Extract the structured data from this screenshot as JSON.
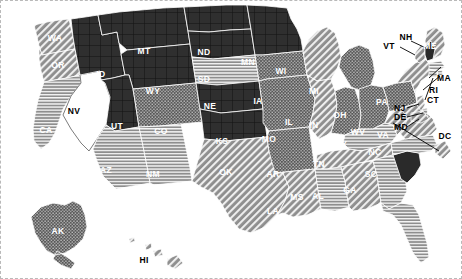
{
  "map": {
    "title": "United States Pattern Choropleth Map",
    "background_color": "#ffffff",
    "border_style": "dashed",
    "border_color": "#b9b9b9",
    "label_light_color": "#ffffff",
    "label_dark_color": "#000000",
    "boundary_color": "#ffffff"
  },
  "legend_patterns": {
    "solid_dark": "#2a2a2a",
    "dark_grid": "#2f2f2f",
    "stipple": "#575757",
    "diagonal_hatch": "#8e8e8e",
    "horizontal_lines": "#8e8e8e",
    "no_data": "#ffffff"
  },
  "states": [
    {
      "code": "WA",
      "pattern": "diagonal_hatch",
      "label_color": "light"
    },
    {
      "code": "OR",
      "pattern": "diagonal_hatch",
      "label_color": "light"
    },
    {
      "code": "CA",
      "pattern": "horizontal_lines",
      "label_color": "light"
    },
    {
      "code": "NV",
      "pattern": "no_data",
      "label_color": "dark"
    },
    {
      "code": "ID",
      "pattern": "dark_grid",
      "label_color": "light"
    },
    {
      "code": "MT",
      "pattern": "dark_grid",
      "label_color": "light"
    },
    {
      "code": "WY",
      "pattern": "dark_grid",
      "label_color": "light"
    },
    {
      "code": "UT",
      "pattern": "dark_grid",
      "label_color": "light"
    },
    {
      "code": "AZ",
      "pattern": "horizontal_lines",
      "label_color": "light"
    },
    {
      "code": "NM",
      "pattern": "horizontal_lines",
      "label_color": "light"
    },
    {
      "code": "CO",
      "pattern": "stipple",
      "label_color": "light"
    },
    {
      "code": "ND",
      "pattern": "dark_grid",
      "label_color": "light"
    },
    {
      "code": "SD",
      "pattern": "dark_grid",
      "label_color": "light"
    },
    {
      "code": "NE",
      "pattern": "horizontal_lines",
      "label_color": "light"
    },
    {
      "code": "KS",
      "pattern": "dark_grid",
      "label_color": "light"
    },
    {
      "code": "OK",
      "pattern": "dark_grid",
      "label_color": "light"
    },
    {
      "code": "TX",
      "pattern": "diagonal_hatch",
      "label_color": "light"
    },
    {
      "code": "MN",
      "pattern": "dark_grid",
      "label_color": "light"
    },
    {
      "code": "IA",
      "pattern": "stipple",
      "label_color": "light"
    },
    {
      "code": "MO",
      "pattern": "stipple",
      "label_color": "light"
    },
    {
      "code": "AR",
      "pattern": "stipple",
      "label_color": "light"
    },
    {
      "code": "LA",
      "pattern": "diagonal_hatch",
      "label_color": "light"
    },
    {
      "code": "WI",
      "pattern": "diagonal_hatch",
      "label_color": "light"
    },
    {
      "code": "IL",
      "pattern": "diagonal_hatch",
      "label_color": "light"
    },
    {
      "code": "MI",
      "pattern": "stipple",
      "label_color": "light"
    },
    {
      "code": "IN",
      "pattern": "stipple",
      "label_color": "light"
    },
    {
      "code": "OH",
      "pattern": "stipple",
      "label_color": "light"
    },
    {
      "code": "KY",
      "pattern": "horizontal_lines",
      "label_color": "light"
    },
    {
      "code": "TN",
      "pattern": "diagonal_hatch",
      "label_color": "light"
    },
    {
      "code": "MS",
      "pattern": "horizontal_lines",
      "label_color": "light"
    },
    {
      "code": "AL",
      "pattern": "diagonal_hatch",
      "label_color": "light"
    },
    {
      "code": "GA",
      "pattern": "horizontal_lines",
      "label_color": "light"
    },
    {
      "code": "FL",
      "pattern": "horizontal_lines",
      "label_color": "light"
    },
    {
      "code": "SC",
      "pattern": "solid_dark",
      "label_color": "light"
    },
    {
      "code": "NC",
      "pattern": "horizontal_lines",
      "label_color": "light"
    },
    {
      "code": "VA",
      "pattern": "diagonal_hatch",
      "label_color": "light"
    },
    {
      "code": "WV",
      "pattern": "diagonal_hatch",
      "label_color": "light"
    },
    {
      "code": "PA",
      "pattern": "stipple",
      "label_color": "light"
    },
    {
      "code": "NY",
      "pattern": "diagonal_hatch",
      "label_color": "light"
    },
    {
      "code": "ME",
      "pattern": "diagonal_hatch",
      "label_color": "light"
    },
    {
      "code": "AK",
      "pattern": "stipple",
      "label_color": "light"
    },
    {
      "code": "HI",
      "pattern": "diagonal_hatch",
      "label_color": "dark"
    }
  ],
  "callout_states": [
    {
      "code": "VT",
      "pattern": "diagonal_hatch"
    },
    {
      "code": "NH",
      "pattern": "solid_dark"
    },
    {
      "code": "MA",
      "pattern": "horizontal_lines"
    },
    {
      "code": "RI",
      "pattern": "horizontal_lines"
    },
    {
      "code": "CT",
      "pattern": "horizontal_lines"
    },
    {
      "code": "NJ",
      "pattern": "diagonal_hatch"
    },
    {
      "code": "DE",
      "pattern": "horizontal_lines"
    },
    {
      "code": "MD",
      "pattern": "diagonal_hatch"
    },
    {
      "code": "DC",
      "pattern": "diagonal_hatch"
    }
  ]
}
